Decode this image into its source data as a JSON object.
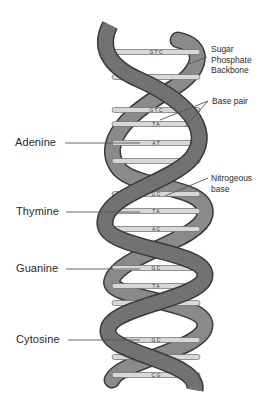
{
  "diagram": {
    "colors": {
      "backbone": "#707070",
      "backbone_edge": "#3a3a3a",
      "rung": "#d8d8d8",
      "rung_edge": "#6a6a6a",
      "leader": "#555555",
      "text": "#2a2a2a"
    }
  },
  "labels": {
    "left": [
      {
        "id": "adenine",
        "text": "Adenine",
        "y": 143
      },
      {
        "id": "thymine",
        "text": "Thymine",
        "y": 212
      },
      {
        "id": "guanine",
        "text": "Guanine",
        "y": 269
      },
      {
        "id": "cytosine",
        "text": "Cytosine",
        "y": 340
      }
    ],
    "right": {
      "backbone": [
        "Sugar",
        "Phosphate",
        "Backbone"
      ],
      "base_pair": "Base pair",
      "nitrogeous": [
        "Nitrogeous",
        "base"
      ]
    }
  },
  "rungs": [
    {
      "y": 52,
      "text": "G T C"
    },
    {
      "y": 77,
      "text": ""
    },
    {
      "y": 110,
      "text": "G T C"
    },
    {
      "y": 124,
      "text": "T A"
    },
    {
      "y": 143,
      "text": "A T"
    },
    {
      "y": 161,
      "text": ""
    },
    {
      "y": 194,
      "text": "G C"
    },
    {
      "y": 211,
      "text": "T A"
    },
    {
      "y": 229,
      "text": "A C"
    },
    {
      "y": 268,
      "text": "G C"
    },
    {
      "y": 286,
      "text": "T A"
    },
    {
      "y": 303,
      "text": "A C"
    },
    {
      "y": 340,
      "text": "G C"
    },
    {
      "y": 357,
      "text": "T A"
    },
    {
      "y": 375,
      "text": "C G"
    }
  ]
}
